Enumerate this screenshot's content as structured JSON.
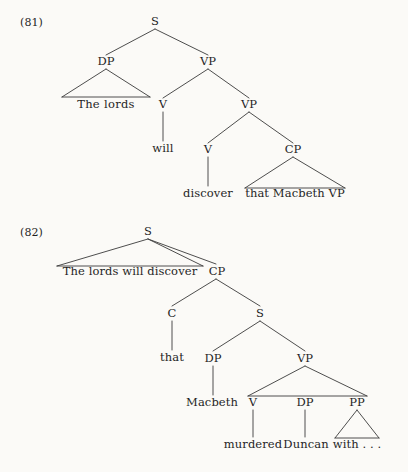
{
  "page": {
    "background_color": "#fbfaf7",
    "ink_color": "#1f1f1f",
    "width": 408,
    "height": 472
  },
  "examples": [
    {
      "number": "(81)",
      "sentence": "The lords will discover that Macbeth VP",
      "nodes": {
        "s": "S",
        "dp": "DP",
        "vp_upper": "VP",
        "v_aux": "V",
        "vp_lower": "VP",
        "v_main": "V",
        "cp": "CP"
      },
      "leaves": {
        "the_lords": "The   lords",
        "will": "will",
        "discover": "discover",
        "that_macbeth_vp": "that Macbeth VP"
      }
    },
    {
      "number": "(82)",
      "sentence": "The lords will discover that Macbeth murdered Duncan with . . .",
      "nodes": {
        "s_top": "S",
        "cp": "CP",
        "c": "C",
        "s_embedded": "S",
        "dp": "DP",
        "vp": "VP",
        "v": "V",
        "dp_object": "DP",
        "pp": "PP"
      },
      "leaves": {
        "the_lords_will_discover": "The lords will discover",
        "that": "that",
        "macbeth": "Macbeth",
        "murdered": "murdered",
        "duncan": "Duncan",
        "with": "with . . ."
      }
    }
  ]
}
